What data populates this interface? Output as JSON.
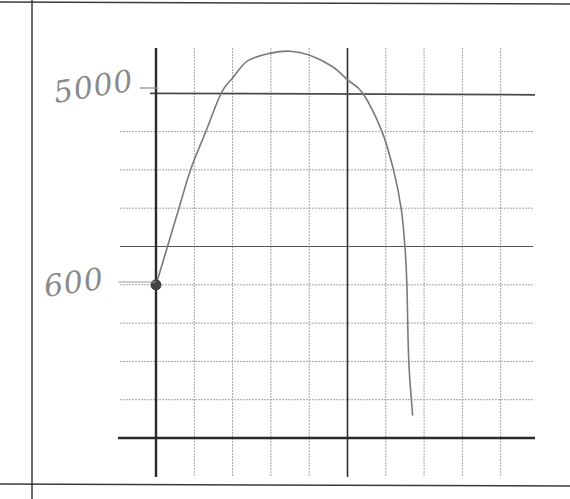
{
  "chart_data": {
    "type": "line",
    "title": "",
    "xlabel": "",
    "ylabel": "",
    "style": "hand-drawn sketch on grid paper",
    "grid": true,
    "legend": null,
    "y_tick_labels": [
      {
        "label": "5000",
        "grid_row_from_top": 1
      },
      {
        "label": "600",
        "grid_row_from_top": 6,
        "marked_point": true
      }
    ],
    "grid_units": {
      "columns_right_of_y_axis": 10,
      "rows_above_x_axis": 9
    },
    "series": [
      {
        "name": "curve",
        "points_grid_units": [
          {
            "x": 0.0,
            "y": 4.0
          },
          {
            "x": 0.3,
            "y": 5.0
          },
          {
            "x": 0.6,
            "y": 6.0
          },
          {
            "x": 0.9,
            "y": 7.0
          },
          {
            "x": 1.3,
            "y": 8.0
          },
          {
            "x": 1.7,
            "y": 9.0
          },
          {
            "x": 2.0,
            "y": 9.4
          },
          {
            "x": 2.4,
            "y": 9.85
          },
          {
            "x": 3.0,
            "y": 10.05
          },
          {
            "x": 3.5,
            "y": 10.1
          },
          {
            "x": 4.0,
            "y": 10.0
          },
          {
            "x": 4.6,
            "y": 9.7
          },
          {
            "x": 5.0,
            "y": 9.35
          },
          {
            "x": 5.4,
            "y": 9.0
          },
          {
            "x": 5.9,
            "y": 8.0
          },
          {
            "x": 6.2,
            "y": 7.0
          },
          {
            "x": 6.4,
            "y": 6.0
          },
          {
            "x": 6.5,
            "y": 5.0
          },
          {
            "x": 6.55,
            "y": 4.0
          },
          {
            "x": 6.6,
            "y": 2.0
          },
          {
            "x": 6.7,
            "y": 0.6
          }
        ]
      }
    ],
    "colors": {
      "curve": "#7a7a7a",
      "axis": "#2a2a2a",
      "grid": "#9a9a9a",
      "label": "#8a8a8a",
      "dot": "#444444"
    }
  },
  "labels": {
    "y_upper": "5000",
    "y_marked": "600"
  }
}
